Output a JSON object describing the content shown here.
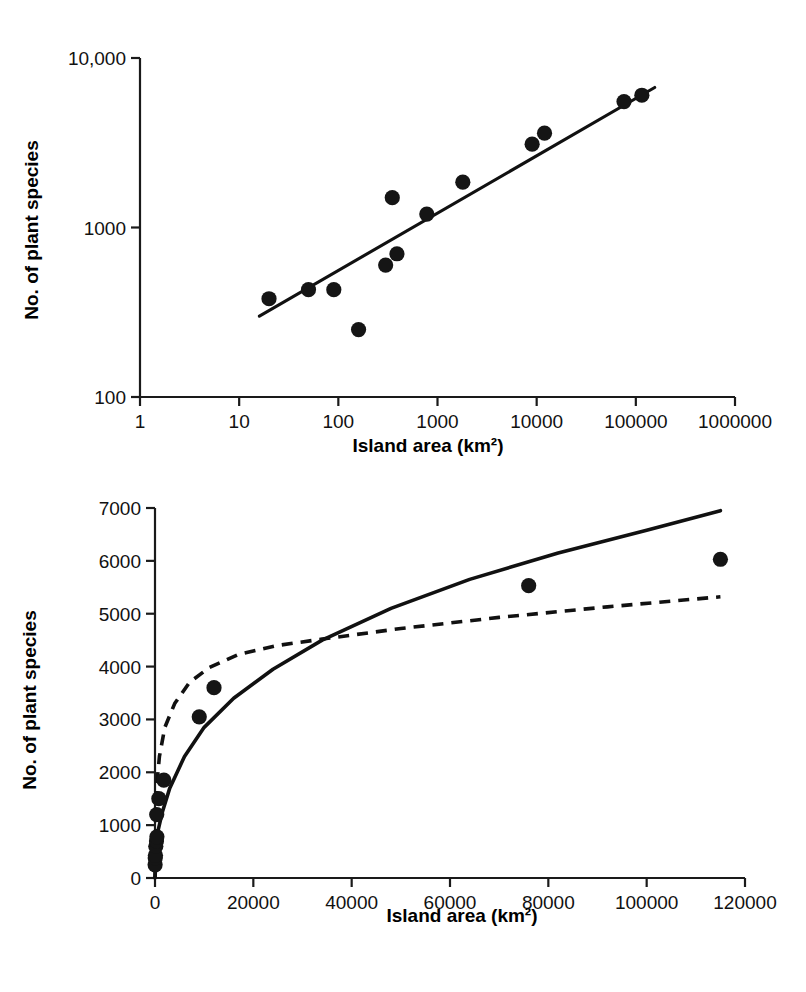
{
  "figure": {
    "panels": [
      "log-log-species-area",
      "linear-species-area"
    ]
  },
  "chart_data": [
    {
      "id": "top",
      "type": "scatter",
      "title": "",
      "xlabel": "Island area (km²)",
      "ylabel": "No. of plant species",
      "xscale": "log",
      "yscale": "log",
      "xlim": [
        1,
        1000000
      ],
      "ylim": [
        100,
        10000
      ],
      "grid": false,
      "legend": "none",
      "xticks": [
        1,
        10,
        100,
        1000,
        10000,
        100000,
        1000000
      ],
      "xticklabels": [
        "1",
        "10",
        "100",
        "1000",
        "10000",
        "100000",
        "1000000"
      ],
      "yticks": [
        100,
        1000,
        10000
      ],
      "yticklabels": [
        "100",
        "1000",
        "10,000"
      ],
      "points": [
        {
          "x": 20,
          "y": 380
        },
        {
          "x": 50,
          "y": 430
        },
        {
          "x": 90,
          "y": 430
        },
        {
          "x": 160,
          "y": 250
        },
        {
          "x": 300,
          "y": 600
        },
        {
          "x": 390,
          "y": 700
        },
        {
          "x": 350,
          "y": 1500
        },
        {
          "x": 780,
          "y": 1200
        },
        {
          "x": 1800,
          "y": 1850
        },
        {
          "x": 9000,
          "y": 3100
        },
        {
          "x": 12000,
          "y": 3600
        },
        {
          "x": 76000,
          "y": 5530
        },
        {
          "x": 115000,
          "y": 6030
        }
      ],
      "fit": {
        "type": "power-law-line",
        "label": "",
        "x_start": 16,
        "x_end": 155000,
        "y_start": 300,
        "y_end": 6700
      }
    },
    {
      "id": "bottom",
      "type": "scatter",
      "title": "",
      "xlabel": "Island area (km²)",
      "ylabel": "No. of plant species",
      "xscale": "linear",
      "yscale": "linear",
      "xlim": [
        0,
        120000
      ],
      "ylim": [
        0,
        7000
      ],
      "grid": false,
      "legend": "none",
      "xticks": [
        0,
        20000,
        40000,
        60000,
        80000,
        100000,
        120000
      ],
      "xticklabels": [
        "0",
        "20000",
        "40000",
        "60000",
        "80000",
        "100000",
        "120000"
      ],
      "yticks": [
        0,
        1000,
        2000,
        3000,
        4000,
        5000,
        6000,
        7000
      ],
      "yticklabels": [
        "0",
        "1000",
        "2000",
        "3000",
        "4000",
        "5000",
        "6000",
        "7000"
      ],
      "points": [
        {
          "x": 20,
          "y": 250
        },
        {
          "x": 50,
          "y": 380
        },
        {
          "x": 90,
          "y": 430
        },
        {
          "x": 160,
          "y": 600
        },
        {
          "x": 300,
          "y": 700
        },
        {
          "x": 390,
          "y": 780
        },
        {
          "x": 350,
          "y": 1200
        },
        {
          "x": 780,
          "y": 1500
        },
        {
          "x": 1800,
          "y": 1850
        },
        {
          "x": 9000,
          "y": 3050
        },
        {
          "x": 12000,
          "y": 3600
        },
        {
          "x": 76000,
          "y": 5530
        },
        {
          "x": 115000,
          "y": 6030
        }
      ],
      "series": [
        {
          "name": "power-function-fit",
          "style": "solid",
          "values": [
            {
              "x": 0,
              "y": 0
            },
            {
              "x": 500,
              "y": 850
            },
            {
              "x": 1500,
              "y": 1250
            },
            {
              "x": 3000,
              "y": 1700
            },
            {
              "x": 6000,
              "y": 2300
            },
            {
              "x": 10000,
              "y": 2850
            },
            {
              "x": 16000,
              "y": 3400
            },
            {
              "x": 24000,
              "y": 3950
            },
            {
              "x": 34000,
              "y": 4500
            },
            {
              "x": 48000,
              "y": 5100
            },
            {
              "x": 64000,
              "y": 5650
            },
            {
              "x": 82000,
              "y": 6150
            },
            {
              "x": 100000,
              "y": 6580
            },
            {
              "x": 115000,
              "y": 6950
            }
          ]
        },
        {
          "name": "asymptotic-fit",
          "style": "dashed",
          "values": [
            {
              "x": 0,
              "y": 0
            },
            {
              "x": 300,
              "y": 1700
            },
            {
              "x": 900,
              "y": 2300
            },
            {
              "x": 2000,
              "y": 2850
            },
            {
              "x": 4000,
              "y": 3300
            },
            {
              "x": 7000,
              "y": 3700
            },
            {
              "x": 11000,
              "y": 3980
            },
            {
              "x": 17000,
              "y": 4230
            },
            {
              "x": 25000,
              "y": 4400
            },
            {
              "x": 34000,
              "y": 4520
            },
            {
              "x": 50000,
              "y": 4720
            },
            {
              "x": 70000,
              "y": 4930
            },
            {
              "x": 92000,
              "y": 5130
            },
            {
              "x": 115000,
              "y": 5320
            }
          ]
        }
      ]
    }
  ]
}
